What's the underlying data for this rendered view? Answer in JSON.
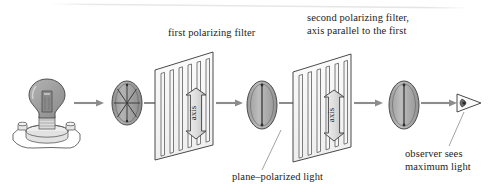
{
  "figure": {
    "type": "physics-optics-diagram",
    "background_color": "#ffffff",
    "line_color": "#4a4a4a",
    "fill_gray": "#9a9a9a",
    "arrow_color": "#8c8c8c",
    "text_color": "#1c1c1c"
  },
  "labels": {
    "first_filter": "first polarizing filter",
    "second_filter_line1": "second polarizing filter,",
    "second_filter_line2": "axis parallel to the first",
    "plane_polarized": "plane–polarized light",
    "observer_line1": "observer sees",
    "observer_line2": "maximum light"
  },
  "filters": {
    "axis_label": "axis",
    "slit_count": 6
  },
  "elements": [
    {
      "name": "light-bulb-source",
      "description": "incandescent light bulb on a round base with two terminal posts",
      "emits": "unpolarized light"
    },
    {
      "name": "unpolarized-light-oval",
      "description": "oval with radiating lines in all directions",
      "ray_count": 8
    },
    {
      "name": "first-polarizing-filter",
      "axis": "vertical"
    },
    {
      "name": "plane-polarized-light-oval",
      "description": "oval with a single vertical line"
    },
    {
      "name": "second-polarizing-filter",
      "axis": "vertical"
    },
    {
      "name": "transmitted-light-oval",
      "description": "oval with a single vertical line"
    },
    {
      "name": "observer-eye",
      "description": "eye viewed side-on as a cone"
    }
  ]
}
